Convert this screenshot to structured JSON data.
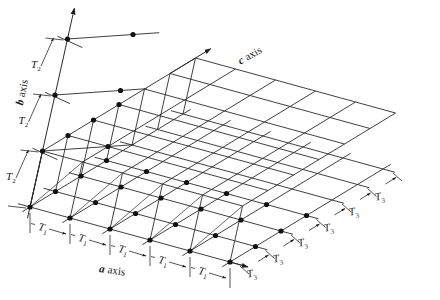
{
  "diagram": {
    "type": "crystal-lattice-3d",
    "colors": {
      "line": "#2a2a2a",
      "dot": "#111111",
      "background": "#ffffff"
    },
    "axes": {
      "a": {
        "letter": "a",
        "word": "axis"
      },
      "b": {
        "letter": "b",
        "word": "axis"
      },
      "c": {
        "letter": "c",
        "word": "axis"
      }
    },
    "periods": {
      "a": {
        "symbol": "T",
        "subscript": "1",
        "count": 5
      },
      "b": {
        "symbol": "T",
        "subscript": "2",
        "count": 3
      },
      "c": {
        "symbol": "T",
        "subscript": "3",
        "count": 6
      }
    },
    "lattice": {
      "a_points": 6,
      "b_points": 4,
      "c_points": 7
    }
  }
}
